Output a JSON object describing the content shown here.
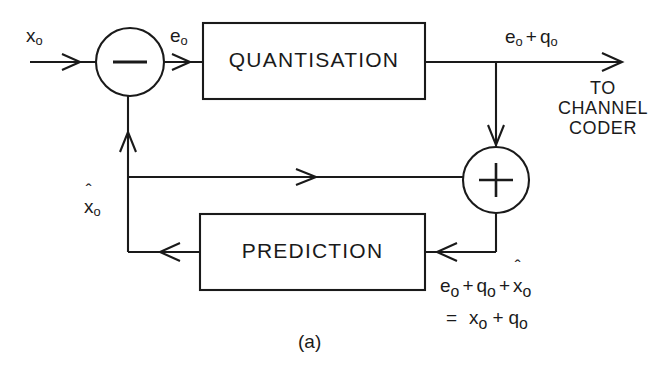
{
  "figure": {
    "caption": "(a)",
    "stroke_color": "#1a1a1a",
    "background_color": "#ffffff"
  },
  "blocks": [
    {
      "id": "quantisation",
      "label": "QUANTISATION"
    },
    {
      "id": "prediction",
      "label": "PREDICTION"
    }
  ],
  "junctions": [
    {
      "id": "subtractor",
      "symbol": "−",
      "name": "minus"
    },
    {
      "id": "adder",
      "symbol": "+",
      "name": "plus"
    }
  ],
  "signals": {
    "input": {
      "base": "x",
      "sub": "o"
    },
    "error": {
      "base": "e",
      "sub": "o"
    },
    "quantised_output": {
      "text": "e",
      "sub1": "o",
      "op": "+",
      "text2": "q",
      "sub2": "o"
    },
    "prediction_feedback": {
      "base": "x",
      "sub": "o",
      "hat": "ˆ"
    }
  },
  "destination": {
    "line1": "TO",
    "line2": "CHANNEL",
    "line3": "CODER"
  },
  "equations": {
    "line1": {
      "t1": "e",
      "s1": "o",
      "op1": "+",
      "t2": "q",
      "s2": "o",
      "op2": "+",
      "t3": "x",
      "s3": "o",
      "hat": "ˆ"
    },
    "line2": {
      "eq": "=",
      "t1": "x",
      "s1": "o",
      "op1": "+",
      "t2": "q",
      "s2": "o"
    }
  }
}
